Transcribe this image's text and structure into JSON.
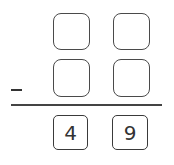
{
  "problem": {
    "operator": "-",
    "minuend_digits": [
      "",
      ""
    ],
    "subtrahend_digits": [
      "",
      ""
    ],
    "result_digits": [
      "4",
      "9"
    ]
  },
  "colors": {
    "stroke": "#4a4a4a",
    "background": "#ffffff"
  }
}
